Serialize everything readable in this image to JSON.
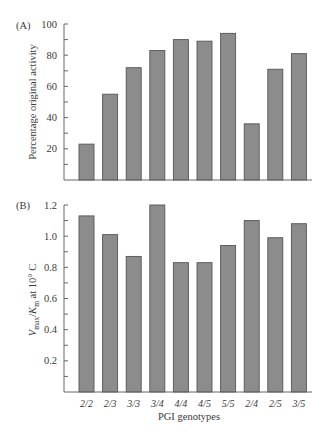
{
  "chart_data": [
    {
      "type": "bar",
      "panel_label": "(A)",
      "title": "",
      "xlabel": "",
      "ylabel": "Percentage original activity",
      "categories": [
        "2/2",
        "2/3",
        "3/3",
        "3/4",
        "4/4",
        "4/5",
        "5/5",
        "2/4",
        "2/5",
        "3/5"
      ],
      "values": [
        23,
        55,
        72,
        83,
        90,
        89,
        94,
        36,
        71,
        81
      ],
      "ylim": [
        0,
        100
      ],
      "yticks": [
        20,
        40,
        60,
        80,
        100
      ],
      "yticks_minor_step": 10,
      "grid": false,
      "legend": null
    },
    {
      "type": "bar",
      "panel_label": "(B)",
      "title": "",
      "xlabel": "PGI genotypes",
      "ylabel": "Vmax/Km at 10° C",
      "ylabel_parts": {
        "v": "V",
        "v_sub": "max",
        "slash": "/",
        "k": "K",
        "k_sub": "m",
        "rest": " at 10° C"
      },
      "categories": [
        "2/2",
        "2/3",
        "3/3",
        "3/4",
        "4/4",
        "4/5",
        "5/5",
        "2/4",
        "2/5",
        "3/5"
      ],
      "values": [
        1.13,
        1.01,
        0.87,
        1.2,
        0.83,
        0.83,
        0.94,
        1.1,
        0.99,
        1.08
      ],
      "ylim": [
        0,
        1.2
      ],
      "yticks": [
        0.2,
        0.4,
        0.6,
        0.8,
        1.0,
        1.2
      ],
      "ytick_labels": [
        "0.2",
        "0.4",
        "0.6",
        "0.8",
        "1.0",
        "1.2"
      ],
      "yticks_minor_step": 0.1,
      "grid": false,
      "legend": null
    }
  ],
  "colors": {
    "bar_fill": "#8c8c8c",
    "bar_stroke": "#555555",
    "axis": "#666666",
    "text": "#3a3a3a"
  }
}
